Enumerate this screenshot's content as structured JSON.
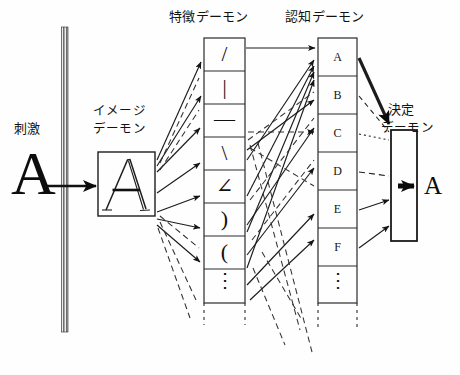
{
  "diagram": {
    "stimulus_label": "刺激",
    "stimulus_glyph": "A",
    "image_demon_label_line1": "イメージ",
    "image_demon_label_line2": "デーモン",
    "image_demon_glyph": "A",
    "feature_demon_label": "特徴デーモン",
    "cognitive_demon_label": "認知デーモン",
    "decision_demon_label_line1": "決定",
    "decision_demon_label_line2": "デーモン",
    "output_glyph": "A",
    "ellipsis_glyph": "⋮"
  },
  "feature_demons": [
    {
      "name": "slash",
      "glyph": "/"
    },
    {
      "name": "vertical-bar",
      "glyph": "|"
    },
    {
      "name": "horizontal-bar",
      "glyph": "—"
    },
    {
      "name": "backslash",
      "glyph": "\\"
    },
    {
      "name": "angle",
      "glyph": "∠"
    },
    {
      "name": "right-paren",
      "glyph": ")"
    },
    {
      "name": "left-paren",
      "glyph": "("
    },
    {
      "name": "more",
      "glyph": "⋮"
    }
  ],
  "cognitive_demons": [
    {
      "name": "a",
      "label": "A"
    },
    {
      "name": "b",
      "label": "B"
    },
    {
      "name": "c",
      "label": "C"
    },
    {
      "name": "d",
      "label": "D"
    },
    {
      "name": "e",
      "label": "E"
    },
    {
      "name": "f",
      "label": "F"
    },
    {
      "name": "more",
      "label": "⋮"
    }
  ],
  "colors": {
    "ink": "#101010",
    "line": "#2b2b2b",
    "paper": "#fefefe",
    "dashed": "#3a3a3a"
  }
}
